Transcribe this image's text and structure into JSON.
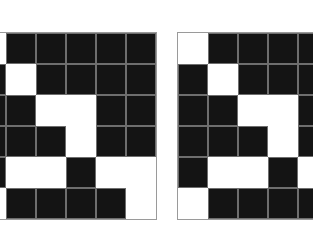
{
  "colors": {
    "filled": "#141414",
    "empty": "#ffffff",
    "gridline": "#6e6e6e",
    "border": "#9a9a9a"
  },
  "grids": [
    {
      "name": "left",
      "rows": [
        [
          0,
          1,
          1,
          1,
          1,
          1
        ],
        [
          1,
          0,
          1,
          1,
          1,
          1
        ],
        [
          1,
          1,
          0,
          0,
          1,
          1
        ],
        [
          1,
          1,
          1,
          0,
          1,
          1
        ],
        [
          1,
          0,
          0,
          1,
          0,
          0
        ],
        [
          0,
          1,
          1,
          1,
          1,
          0
        ]
      ]
    },
    {
      "name": "right",
      "rows": [
        [
          0,
          1,
          1,
          1,
          1,
          1
        ],
        [
          1,
          0,
          1,
          1,
          1,
          1
        ],
        [
          1,
          1,
          0,
          0,
          1,
          1
        ],
        [
          1,
          1,
          1,
          0,
          1,
          1
        ],
        [
          1,
          0,
          0,
          1,
          0,
          0
        ],
        [
          0,
          1,
          1,
          1,
          1,
          0
        ]
      ]
    }
  ]
}
